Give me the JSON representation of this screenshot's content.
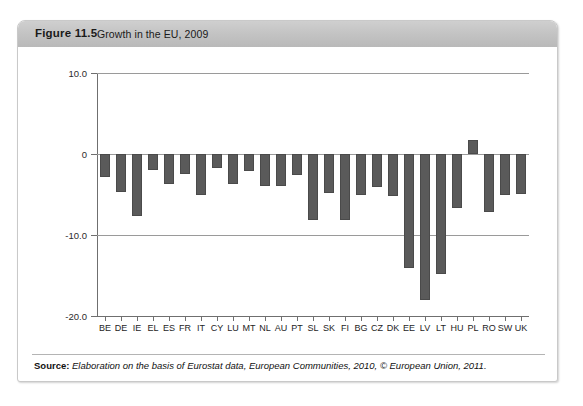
{
  "figure": {
    "number": "Figure 11.5",
    "title": "Growth in the EU, 2009"
  },
  "source": {
    "label": "Source:",
    "text": " Elaboration on the basis of Eurostat data, European Communities, 2010, © European Union, 2011."
  },
  "colors": {
    "bar": "#5a5a5a",
    "header_band": "#c2c2c2",
    "axis": "#6f6f6f",
    "gridline": "#9a9a9a",
    "card_border": "#c9c9c9"
  },
  "chart_data": {
    "type": "bar",
    "title": "Growth in the EU, 2009",
    "xlabel": "",
    "ylabel": "",
    "ylim": [
      -20.0,
      10.0
    ],
    "yticks": [
      10.0,
      0,
      -10.0,
      -20.0
    ],
    "ytick_labels": [
      "10.0",
      "0",
      "-10.0",
      "-20.0"
    ],
    "grid": true,
    "legend": "none",
    "categories": [
      "BE",
      "DE",
      "IE",
      "EL",
      "ES",
      "FR",
      "IT",
      "CY",
      "LU",
      "MT",
      "NL",
      "AU",
      "PT",
      "SL",
      "SK",
      "FI",
      "BG",
      "CZ",
      "DK",
      "EE",
      "LV",
      "LT",
      "HU",
      "PL",
      "RO",
      "SW",
      "UK"
    ],
    "values": [
      -2.8,
      -4.7,
      -7.6,
      -2.0,
      -3.7,
      -2.5,
      -5.0,
      -1.7,
      -3.7,
      -2.1,
      -3.9,
      -3.9,
      -2.6,
      -8.1,
      -4.8,
      -8.2,
      -5.0,
      -4.1,
      -5.2,
      -14.1,
      -18.0,
      -14.8,
      -6.7,
      1.7,
      -7.1,
      -5.1,
      -4.9
    ]
  }
}
